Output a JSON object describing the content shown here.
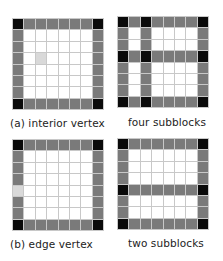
{
  "panels": [
    {
      "id": "interior-vertex",
      "label": "(a) interior vertex",
      "rows": [
        "KGGGGGGK",
        "GWWWWWWG",
        "GWWWWWWG",
        "GWLWWWWG",
        "GWWWWWWG",
        "GWWWWWWG",
        "GWWWWWWG",
        "KGGGGGGK"
      ]
    },
    {
      "id": "four-subblocks",
      "label": "four subblocks",
      "rows": [
        "KGKGGGGK",
        "GWGWWWWG",
        "GWGWWWWG",
        "KGKGGGGK",
        "GWGWWWWG",
        "GWGWWWWG",
        "GWGWWWWG",
        "KGKGGGGK"
      ]
    },
    {
      "id": "edge-vertex",
      "label": "(b) edge vertex",
      "rows": [
        "KGGGGGGK",
        "GWWWWWWG",
        "GWWWWWWG",
        "GWWWWWWG",
        "LWWWWWWG",
        "GWWWWWWG",
        "GWWWWWWG",
        "KGGGGGGK"
      ]
    },
    {
      "id": "two-subblocks",
      "label": "two subblocks",
      "rows": [
        "KGGGGGGK",
        "GWWWWWWG",
        "GWWWWWWG",
        "GWWWWWWG",
        "KGGGGGGK",
        "GWWWWWWG",
        "GWWWWWWG",
        "KGGGGGGK"
      ]
    }
  ],
  "legend": {
    "K": "vertex (black)",
    "G": "edge (dark gray)",
    "W": "interior (white)",
    "L": "highlighted cell (light gray)"
  },
  "colors": {
    "vertex": "#0a0a0a",
    "edge": "#7a7a7a",
    "interior": "#ffffff",
    "highlight": "#d9d9d9",
    "gridline": "#c8c8c8"
  }
}
